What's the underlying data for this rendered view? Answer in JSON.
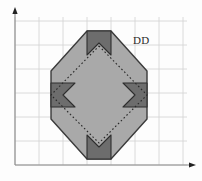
{
  "figure": {
    "width": 202,
    "height": 181,
    "background_color": "#fdfdfd",
    "label": {
      "text": "DD",
      "x": 133,
      "y": 34
    },
    "colors": {
      "grid": "#d6d6d6",
      "axis": "#8a8a8a",
      "octagon_fill": "#a9a9a9",
      "octagon_stroke": "#3a3a3a",
      "corner_square_fill": "#6d6d6d",
      "corner_square_stroke": "#2f2f2f",
      "diamond_stroke": "#2b2b2b",
      "label_color": "#2b2b2b"
    },
    "grid": {
      "spacing": 24,
      "x_lines": [
        15,
        39,
        63,
        87,
        111,
        135,
        159,
        183
      ],
      "y_lines": [
        21,
        45,
        69,
        93,
        117,
        141,
        165
      ],
      "visible": true
    },
    "axes": {
      "x_axis": {
        "y": 165,
        "x_start": 15,
        "x_end": 190,
        "arrow": "right"
      },
      "y_axis": {
        "x": 15,
        "y_start": 165,
        "y_end": 12,
        "arrow": "up"
      }
    },
    "shapes": {
      "octagon": {
        "name": "octagon",
        "points": "87,31 111,31 147,71 147,119 111,159 87,159 51,119 51,71"
      },
      "diamond": {
        "name": "inscribed-dotted-diamond",
        "points": "99,46 147,95 99,143 51,95",
        "dash": "1.6 2.4"
      },
      "notched_squares": [
        {
          "name": "top-notched-square",
          "points": "87,31 111,31 111,55 99,43 87,55"
        },
        {
          "name": "right-notched-square",
          "points": "147,83 147,107 123,107 135,95 123,83"
        },
        {
          "name": "bottom-notched-square",
          "points": "87,159 87,135 99,147 111,135 111,159"
        },
        {
          "name": "left-notched-square",
          "points": "51,83 75,83 63,95 75,107 51,107"
        }
      ]
    }
  }
}
